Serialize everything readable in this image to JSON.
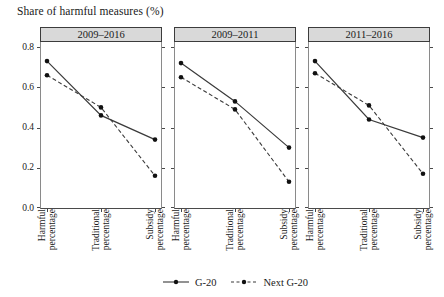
{
  "figure": {
    "title": "Share of harmful measures (%)"
  },
  "colors": {
    "line": "#3a3a3a",
    "marker": "#111111",
    "strip_bg": "#d9d9d9",
    "strip_border": "#3c3c3c",
    "axis": "#4a4a4a",
    "side_border": "#8a8a8a"
  },
  "x_labels": [
    [
      "Harmful",
      "percentage"
    ],
    [
      "Traditional",
      "percentage"
    ],
    [
      "Subsidy",
      "percentage"
    ]
  ],
  "yticks": [
    {
      "value": 0.8,
      "label": "0.8"
    },
    {
      "value": 0.6,
      "label": "0.6"
    },
    {
      "value": 0.4,
      "label": "0.4"
    },
    {
      "value": 0.2,
      "label": "0.2"
    },
    {
      "value": 0.0,
      "label": "0.0"
    }
  ],
  "legend": {
    "items": [
      {
        "label": "G-20",
        "style": "solid"
      },
      {
        "label": "Next G-20",
        "style": "dashed"
      }
    ]
  },
  "chart_data": [
    {
      "type": "line",
      "title": "2009–2016",
      "categories": [
        "Harmful percentage",
        "Traditional percentage",
        "Subsidy percentage"
      ],
      "series": [
        {
          "name": "G-20",
          "style": "solid",
          "marker": "circle",
          "values": [
            0.73,
            0.46,
            0.34
          ]
        },
        {
          "name": "Next G-20",
          "style": "dashed",
          "marker": "circle",
          "values": [
            0.66,
            0.5,
            0.16
          ]
        }
      ],
      "ylabel": "Share of harmful measures (%)",
      "xlabel": "",
      "ylim": [
        0.0,
        0.85
      ],
      "yticks": [
        0.0,
        0.2,
        0.4,
        0.6,
        0.8
      ],
      "grid": false,
      "legend_position": "bottom"
    },
    {
      "type": "line",
      "title": "2009–2011",
      "categories": [
        "Harmful percentage",
        "Traditional percentage",
        "Subsidy percentage"
      ],
      "series": [
        {
          "name": "G-20",
          "style": "solid",
          "marker": "circle",
          "values": [
            0.72,
            0.53,
            0.3
          ]
        },
        {
          "name": "Next G-20",
          "style": "dashed",
          "marker": "circle",
          "values": [
            0.65,
            0.49,
            0.13
          ]
        }
      ],
      "ylabel": "Share of harmful measures (%)",
      "xlabel": "",
      "ylim": [
        0.0,
        0.85
      ],
      "yticks": [
        0.0,
        0.2,
        0.4,
        0.6,
        0.8
      ],
      "grid": false,
      "legend_position": "bottom"
    },
    {
      "type": "line",
      "title": "2011–2016",
      "categories": [
        "Harmful percentage",
        "Traditional percentage",
        "Subsidy percentage"
      ],
      "series": [
        {
          "name": "G-20",
          "style": "solid",
          "marker": "circle",
          "values": [
            0.73,
            0.44,
            0.35
          ]
        },
        {
          "name": "Next G-20",
          "style": "dashed",
          "marker": "circle",
          "values": [
            0.67,
            0.51,
            0.17
          ]
        }
      ],
      "ylabel": "Share of harmful measures (%)",
      "xlabel": "",
      "ylim": [
        0.0,
        0.85
      ],
      "yticks": [
        0.0,
        0.2,
        0.4,
        0.6,
        0.8
      ],
      "grid": false,
      "legend_position": "bottom"
    }
  ]
}
